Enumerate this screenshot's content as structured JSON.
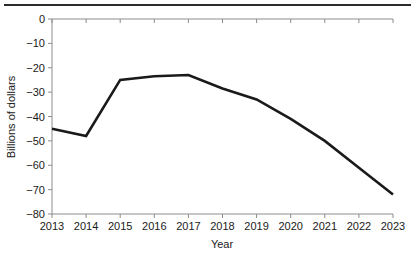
{
  "figure": {
    "top_rule": "horizontal-rule",
    "background_color": "#ffffff"
  },
  "chart_data": {
    "type": "line",
    "title": "",
    "subtitle": "",
    "xlabel": "Year",
    "ylabel": "Billions of dollars",
    "x": [
      2013,
      2014,
      2015,
      2016,
      2017,
      2018,
      2019,
      2020,
      2021,
      2022,
      2023
    ],
    "categories": [
      "2013",
      "2014",
      "2015",
      "2016",
      "2017",
      "2018",
      "2019",
      "2020",
      "2021",
      "2022",
      "2023"
    ],
    "values": [
      -45,
      -48,
      -25,
      -23.5,
      -23,
      -28.5,
      -33,
      -41,
      -50,
      -61,
      -72
    ],
    "series": [
      {
        "name": "Billions of dollars",
        "values": [
          -45,
          -48,
          -25,
          -23.5,
          -23,
          -28.5,
          -33,
          -41,
          -50,
          -61,
          -72
        ],
        "color": "#1a1a1a",
        "line_width": 2.6
      }
    ],
    "xlim": [
      2013,
      2023
    ],
    "ylim": [
      -80,
      0
    ],
    "yticks": [
      0,
      -10,
      -20,
      -30,
      -40,
      -50,
      -60,
      -70,
      -80
    ],
    "ytick_labels": [
      "0",
      "−10",
      "−20",
      "−30",
      "−40",
      "−50",
      "−60",
      "−70",
      "−80"
    ],
    "xticks": [
      2013,
      2014,
      2015,
      2016,
      2017,
      2018,
      2019,
      2020,
      2021,
      2022,
      2023
    ],
    "xtick_labels": [
      "2013",
      "2014",
      "2015",
      "2016",
      "2017",
      "2018",
      "2019",
      "2020",
      "2021",
      "2022",
      "2023"
    ],
    "grid": false,
    "legend": false,
    "legend_position": "none",
    "axis_color": "#8c8c8c",
    "spines": {
      "top": true,
      "bottom": true,
      "left": true,
      "right": false
    },
    "annotations": []
  }
}
